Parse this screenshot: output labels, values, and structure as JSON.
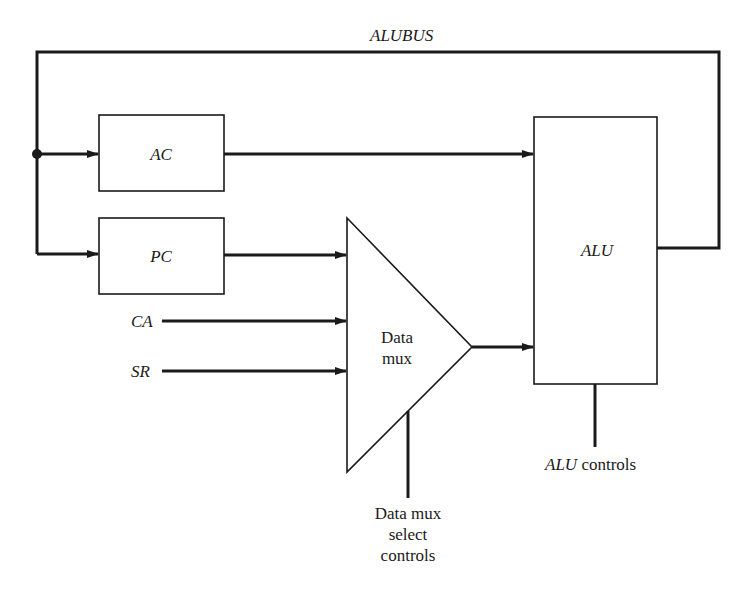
{
  "diagram": {
    "bus_label": "ALUBUS",
    "blocks": {
      "ac": "AC",
      "pc": "PC",
      "alu": "ALU",
      "mux_line1": "Data",
      "mux_line2": "mux"
    },
    "inputs": {
      "ca": "CA",
      "sr": "SR"
    },
    "controls": {
      "mux_select_line1": "Data mux",
      "mux_select_line2": "select",
      "mux_select_line3": "controls",
      "alu_controls_italic": "ALU",
      "alu_controls_rest": " controls"
    },
    "colors": {
      "stroke": "#1a1a1a",
      "background": "#ffffff"
    }
  }
}
